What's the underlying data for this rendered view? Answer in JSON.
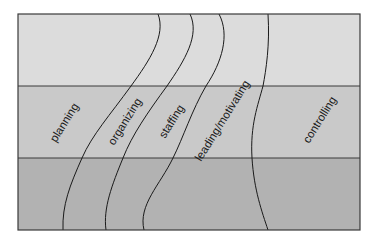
{
  "diagram": {
    "type": "management-functions-bands",
    "bands": [
      {
        "name": "top-band",
        "color": "#dcdcdc"
      },
      {
        "name": "middle-band",
        "color": "#c9c9c9"
      },
      {
        "name": "bottom-band",
        "color": "#b2b2b2"
      }
    ],
    "border_color": "#3a3a3a",
    "labels": [
      {
        "id": "planning",
        "text": "planning"
      },
      {
        "id": "organizing",
        "text": "organizing"
      },
      {
        "id": "staffing",
        "text": "staffing"
      },
      {
        "id": "leading",
        "text": "leading/motivating"
      },
      {
        "id": "controlling",
        "text": "controlling"
      }
    ]
  }
}
